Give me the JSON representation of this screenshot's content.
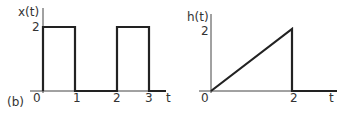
{
  "figure_label": "(b)",
  "plots": [
    {
      "name": "x-of-t",
      "ylabel": "x(t)",
      "xlabel": "t",
      "ytick": "2",
      "xticks": [
        "0",
        "1",
        "2",
        "3"
      ],
      "description": "rectangular pulses of height 2 on [0,1] and [2,3]"
    },
    {
      "name": "h-of-t",
      "ylabel": "h(t)",
      "xlabel": "t",
      "ytick": "2",
      "xticks": [
        "0",
        "2"
      ],
      "description": "ramp from 0 at t=0 to 2 at t=2, then 0"
    }
  ],
  "colors": {
    "line": "#222222",
    "axis": "#444444",
    "text": "#333333"
  }
}
